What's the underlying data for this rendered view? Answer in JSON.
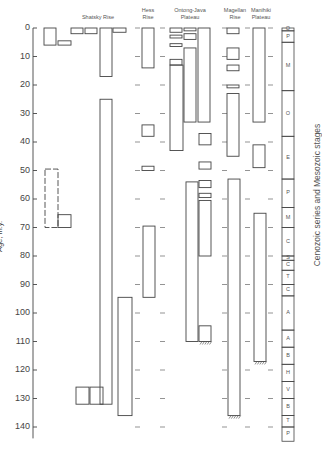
{
  "headers": {
    "shatsky": "Shatsky Rise",
    "hess": "Hess\nRise",
    "ontong": "Ontong-Java\nPlateau",
    "magellan": "Magellan\nRise",
    "manihiki": "Manihiki\nPlateau"
  },
  "axis": {
    "label": "Age, m.y.",
    "ticks": [
      "0",
      "10",
      "20",
      "30",
      "40",
      "50",
      "60",
      "70",
      "80",
      "90",
      "100",
      "110",
      "120",
      "130",
      "140"
    ]
  },
  "right_label": "Cenozoic series and Mesozoic stages",
  "stages": [
    {
      "label": "Q",
      "from": 0,
      "to": 1
    },
    {
      "label": "P",
      "from": 1,
      "to": 5
    },
    {
      "label": "M",
      "from": 5,
      "to": 22
    },
    {
      "label": "O",
      "from": 22,
      "to": 38
    },
    {
      "label": "E",
      "from": 38,
      "to": 53
    },
    {
      "label": "P",
      "from": 53,
      "to": 63
    },
    {
      "label": "M",
      "from": 63,
      "to": 70
    },
    {
      "label": "C",
      "from": 70,
      "to": 80
    },
    {
      "label": "S",
      "from": 80,
      "to": 81.5
    },
    {
      "label": "C",
      "from": 81.5,
      "to": 85
    },
    {
      "label": "T",
      "from": 85,
      "to": 90
    },
    {
      "label": "C",
      "from": 90,
      "to": 94
    },
    {
      "label": "A",
      "from": 94,
      "to": 106
    },
    {
      "label": "A",
      "from": 106,
      "to": 112
    },
    {
      "label": "B",
      "from": 112,
      "to": 118
    },
    {
      "label": "H",
      "from": 118,
      "to": 124
    },
    {
      "label": "V",
      "from": 124,
      "to": 130
    },
    {
      "label": "B",
      "from": 130,
      "to": 136
    },
    {
      "label": "T",
      "from": 136,
      "to": 140
    },
    {
      "label": "P",
      "from": 140,
      "to": 145
    }
  ],
  "chart_data": {
    "type": "range-diagram",
    "title": "",
    "xlabel": "",
    "ylabel": "Age, m.y.",
    "ylim": [
      0,
      145
    ],
    "columns": [
      "Shatsky Rise",
      "Hess Rise",
      "Ontong-Java Plateau",
      "Magellan Rise",
      "Manihiki Plateau"
    ],
    "intervals": [
      {
        "site": "Shatsky Rise",
        "x": 44,
        "w": 12,
        "from": 0,
        "to": 6
      },
      {
        "site": "Shatsky Rise",
        "x": 58,
        "w": 13,
        "from": 4.5,
        "to": 6
      },
      {
        "site": "Shatsky Rise",
        "x": 71,
        "w": 12,
        "from": 0,
        "to": 2
      },
      {
        "site": "Shatsky Rise",
        "x": 85,
        "w": 12,
        "from": 0,
        "to": 2
      },
      {
        "site": "Shatsky Rise",
        "x": 100,
        "w": 12,
        "from": 0,
        "to": 17
      },
      {
        "site": "Shatsky Rise",
        "x": 113,
        "w": 13,
        "from": 0,
        "to": 1.5
      },
      {
        "site": "Shatsky Rise",
        "x": 100,
        "w": 12,
        "from": 25,
        "to": 132
      },
      {
        "site": "Shatsky Rise",
        "x": 45,
        "w": 13,
        "from": 49.5,
        "to": 70,
        "dashed": true
      },
      {
        "site": "Shatsky Rise",
        "x": 58,
        "w": 13,
        "from": 65.5,
        "to": 70
      },
      {
        "site": "Shatsky Rise",
        "x": 76,
        "w": 13,
        "from": 126,
        "to": 132
      },
      {
        "site": "Shatsky Rise",
        "x": 90,
        "w": 13,
        "from": 126,
        "to": 132
      },
      {
        "site": "Shatsky Rise",
        "x": 118,
        "w": 14,
        "from": 94.5,
        "to": 136
      },
      {
        "site": "Hess Rise",
        "x": 142,
        "w": 12,
        "from": 0,
        "to": 14
      },
      {
        "site": "Hess Rise",
        "x": 142,
        "w": 12,
        "from": 34,
        "to": 38
      },
      {
        "site": "Hess Rise",
        "x": 142,
        "w": 12,
        "from": 48.5,
        "to": 50
      },
      {
        "site": "Hess Rise",
        "x": 143,
        "w": 12,
        "from": 69.5,
        "to": 94.5,
        "dotted_top": true
      },
      {
        "site": "Ontong-Java Plateau",
        "x": 170,
        "w": 12,
        "from": 0,
        "to": 1.5
      },
      {
        "site": "Ontong-Java Plateau",
        "x": 184,
        "w": 12,
        "from": 0,
        "to": 1
      },
      {
        "site": "Ontong-Java Plateau",
        "x": 170,
        "w": 12,
        "from": 2.5,
        "to": 3.5
      },
      {
        "site": "Ontong-Java Plateau",
        "x": 184,
        "w": 12,
        "from": 2,
        "to": 4
      },
      {
        "site": "Ontong-Java Plateau",
        "x": 170,
        "w": 12,
        "from": 5.5,
        "to": 6.5
      },
      {
        "site": "Ontong-Java Plateau",
        "x": 170,
        "w": 12,
        "from": 11,
        "to": 13
      },
      {
        "site": "Ontong-Java Plateau",
        "x": 170,
        "w": 13,
        "from": 13,
        "to": 43
      },
      {
        "site": "Ontong-Java Plateau",
        "x": 184,
        "w": 12,
        "from": 7,
        "to": 33
      },
      {
        "site": "Ontong-Java Plateau",
        "x": 198,
        "w": 12,
        "from": 0,
        "to": 33
      },
      {
        "site": "Ontong-Java Plateau",
        "x": 199,
        "w": 12,
        "from": 37,
        "to": 41
      },
      {
        "site": "Ontong-Java Plateau",
        "x": 199,
        "w": 12,
        "from": 47,
        "to": 49.5
      },
      {
        "site": "Ontong-Java Plateau",
        "x": 199,
        "w": 12,
        "from": 53.5,
        "to": 56
      },
      {
        "site": "Ontong-Java Plateau",
        "x": 199,
        "w": 12,
        "from": 58,
        "to": 59.5
      },
      {
        "site": "Ontong-Java Plateau",
        "x": 199,
        "w": 12,
        "from": 60.5,
        "to": 80
      },
      {
        "site": "Ontong-Java Plateau",
        "x": 186,
        "w": 12,
        "from": 54,
        "to": 110
      },
      {
        "site": "Ontong-Java Plateau",
        "x": 199,
        "w": 12,
        "from": 104.5,
        "to": 110
      },
      {
        "site": "Magellan Rise",
        "x": 227,
        "w": 12,
        "from": 0,
        "to": 2
      },
      {
        "site": "Magellan Rise",
        "x": 227,
        "w": 12,
        "from": 7,
        "to": 11
      },
      {
        "site": "Magellan Rise",
        "x": 227,
        "w": 12,
        "from": 13,
        "to": 15
      },
      {
        "site": "Magellan Rise",
        "x": 227,
        "w": 12,
        "from": 20,
        "to": 21
      },
      {
        "site": "Magellan Rise",
        "x": 227,
        "w": 12,
        "from": 23,
        "to": 45
      },
      {
        "site": "Magellan Rise",
        "x": 228,
        "w": 12,
        "from": 53,
        "to": 136
      },
      {
        "site": "Manihiki Plateau",
        "x": 253,
        "w": 12,
        "from": 0,
        "to": 33
      },
      {
        "site": "Manihiki Plateau",
        "x": 253,
        "w": 12,
        "from": 41,
        "to": 49
      },
      {
        "site": "Manihiki Plateau",
        "x": 254,
        "w": 12,
        "from": 65,
        "to": 117
      }
    ]
  }
}
